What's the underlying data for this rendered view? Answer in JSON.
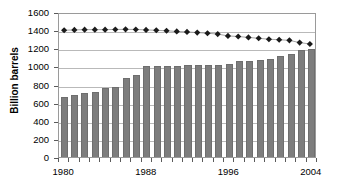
{
  "chart_data": {
    "type": "bar",
    "title": "",
    "xlabel": "",
    "ylabel": "Billion barrels",
    "ylim": [
      0,
      1600
    ],
    "ytick_values": [
      0,
      200,
      400,
      600,
      800,
      1000,
      1200,
      1400,
      1600
    ],
    "ytick_labels": [
      "0",
      "200",
      "400",
      "600",
      "800",
      "1000",
      "1200",
      "1400",
      "1600"
    ],
    "grid": true,
    "legend": "none",
    "categories": [
      1980,
      1981,
      1982,
      1983,
      1984,
      1985,
      1986,
      1987,
      1988,
      1989,
      1990,
      1991,
      1992,
      1993,
      1994,
      1995,
      1996,
      1997,
      1998,
      1999,
      2000,
      2001,
      2002,
      2003,
      2004
    ],
    "xtick_labels": [
      "1980",
      "1988",
      "1996",
      "2004"
    ],
    "xtick_positions": [
      1980,
      1988,
      1996,
      2004
    ],
    "series": [
      {
        "name": "Proved reserves",
        "type": "bar",
        "color": "#7d7d7d",
        "values": [
          660,
          685,
          710,
          722,
          760,
          768,
          875,
          905,
          1000,
          1000,
          1000,
          1005,
          1010,
          1010,
          1012,
          1020,
          1030,
          1055,
          1063,
          1075,
          1085,
          1115,
          1135,
          1180,
          1190
        ]
      },
      {
        "name": "Reserves-to-production",
        "type": "line",
        "marker": "diamond",
        "color": "#1a1a1a",
        "values": [
          1418,
          1422,
          1425,
          1425,
          1425,
          1427,
          1428,
          1427,
          1422,
          1418,
          1412,
          1405,
          1400,
          1392,
          1385,
          1375,
          1355,
          1348,
          1338,
          1328,
          1318,
          1312,
          1305,
          1280,
          1265
        ]
      }
    ]
  }
}
